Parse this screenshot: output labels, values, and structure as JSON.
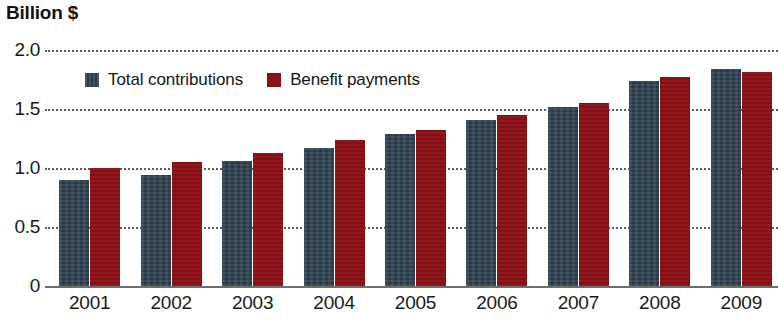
{
  "chart_data": {
    "type": "bar",
    "title": "Billion $",
    "subtitle": "",
    "xlabel": "",
    "ylabel": "Billion $",
    "ylim": [
      0,
      2.0
    ],
    "yticks": [
      0,
      0.5,
      1.0,
      1.5,
      2.0
    ],
    "ytick_labels": [
      "0",
      "0.5",
      "1.0",
      "1.5",
      "2.0"
    ],
    "grid": true,
    "grid_style": "dotted-horizontal",
    "legend_position": "top-left-inside",
    "categories": [
      "2001",
      "2002",
      "2003",
      "2004",
      "2005",
      "2006",
      "2007",
      "2008",
      "2009"
    ],
    "series": [
      {
        "name": "Total contributions",
        "color": "#2f4050",
        "values": [
          0.9,
          0.94,
          1.06,
          1.17,
          1.29,
          1.41,
          1.52,
          1.74,
          1.84
        ]
      },
      {
        "name": "Benefit payments",
        "color": "#8d1016",
        "values": [
          1.0,
          1.05,
          1.13,
          1.24,
          1.32,
          1.45,
          1.55,
          1.77,
          1.81
        ]
      }
    ]
  },
  "axis": {
    "title": "Billion $"
  },
  "legend": {
    "items": [
      {
        "label": "Total contributions",
        "color": "#2f4050"
      },
      {
        "label": "Benefit payments",
        "color": "#8d1016"
      }
    ]
  },
  "colors": {
    "series_blue": "#2f4050",
    "series_red": "#8d1016",
    "gridline": "#5b5b5b",
    "baseline": "#6e6e6e",
    "text": "#1a1a1a",
    "background": "#ffffff"
  }
}
